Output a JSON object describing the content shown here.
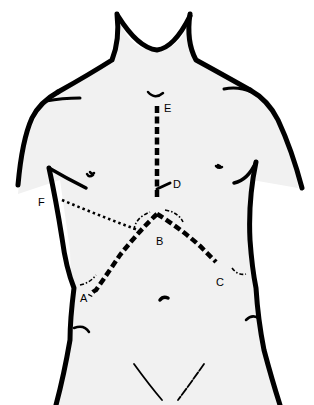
{
  "figure": {
    "type": "anatomical-line-drawing",
    "labels": {
      "A": "A",
      "B": "B",
      "C": "C",
      "D": "D",
      "E": "E",
      "F": "F"
    },
    "colors": {
      "line": "#000000",
      "skin": "#f1f1f1",
      "background": "#ffffff"
    }
  }
}
